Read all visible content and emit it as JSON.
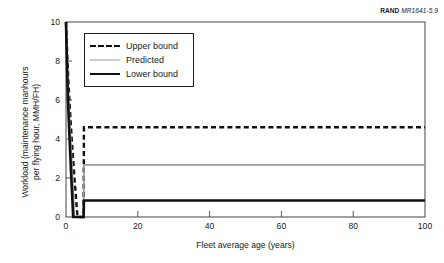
{
  "credit": {
    "brand": "RAND",
    "document_id": "MR1641-5.9"
  },
  "chart_data": {
    "type": "line",
    "title": "",
    "xlabel": "Fleet average age (years)",
    "ylabel": "Workload (maintenance manhours per flying hour, MMH/FH)",
    "ylabel_line1": "Workload (maintenance manhours",
    "ylabel_line2": "per flying hour, MMH/FH)",
    "xlim": [
      0,
      100
    ],
    "ylim": [
      0,
      10
    ],
    "xticks": [
      0,
      20,
      40,
      60,
      80,
      100
    ],
    "yticks": [
      0,
      2,
      4,
      6,
      8,
      10
    ],
    "grid": false,
    "legend_position": "upper left inside",
    "series": [
      {
        "name": "Upper bound",
        "style": "dashed",
        "color": "#111111",
        "plateau": 4.6,
        "x": [
          0.0,
          0.2,
          0.6,
          1.0,
          1.6,
          2.2,
          2.9,
          3.2,
          4.9,
          5.0,
          20,
          40,
          60,
          80,
          100
        ],
        "y": [
          10.0,
          9.0,
          7.2,
          5.8,
          4.0,
          2.4,
          0.7,
          0.0,
          0.0,
          4.6,
          4.6,
          4.6,
          4.6,
          4.6,
          4.6
        ]
      },
      {
        "name": "Predicted",
        "style": "solid",
        "color": "#9a9a9a",
        "plateau": 2.67,
        "x": [
          0.0,
          0.2,
          0.6,
          1.0,
          1.6,
          2.0,
          2.3,
          4.9,
          5.0,
          20,
          40,
          60,
          80,
          100
        ],
        "y": [
          10.0,
          8.6,
          6.6,
          5.0,
          2.9,
          1.4,
          0.0,
          0.0,
          2.67,
          2.67,
          2.67,
          2.67,
          2.67,
          2.67
        ]
      },
      {
        "name": "Lower bound",
        "style": "solid",
        "color": "#111111",
        "plateau": 0.85,
        "x": [
          0.0,
          0.2,
          0.5,
          0.9,
          1.4,
          1.8,
          2.0,
          4.9,
          5.0,
          20,
          40,
          60,
          80,
          100
        ],
        "y": [
          10.0,
          8.4,
          6.2,
          4.4,
          2.3,
          0.8,
          0.0,
          0.0,
          0.85,
          0.85,
          0.85,
          0.85,
          0.85,
          0.85
        ]
      }
    ]
  },
  "legend": {
    "items": [
      {
        "label": "Upper bound"
      },
      {
        "label": "Predicted"
      },
      {
        "label": "Lower bound"
      }
    ]
  },
  "axis_tick_labels": {
    "y": [
      "10",
      "8",
      "6",
      "4",
      "2",
      "0"
    ],
    "x": [
      "0",
      "20",
      "40",
      "60",
      "80",
      "100"
    ]
  }
}
